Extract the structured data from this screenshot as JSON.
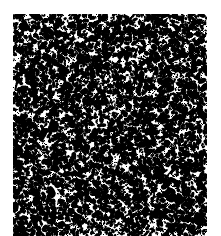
{
  "image": {
    "kind": "speckle-noise-texture",
    "description": "Random black speckle / grain noise texture on white background",
    "width": 221,
    "height": 236,
    "background_color": "#ffffff",
    "speckle_color": "#000000",
    "margin_color": "#ffffff"
  },
  "noise_field": {
    "label": "speckle noise field",
    "x": 13,
    "y": 14,
    "width": 194,
    "height": 222,
    "bleeds_off_bottom": true,
    "coverage_fraction": 0.3,
    "speckle_count": 7200,
    "speckle_min_size_px": 1,
    "speckle_max_size_px": 4,
    "density_uniform": true,
    "random_seed": 20240617
  },
  "margins": {
    "left_px": 13,
    "top_px": 14,
    "right_px": 14,
    "bottom_px": 0
  }
}
